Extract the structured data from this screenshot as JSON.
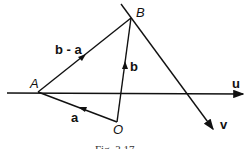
{
  "figure": {
    "points": {
      "A": "A",
      "B": "B",
      "O": "O"
    },
    "vectors": {
      "a": "a",
      "b": "b",
      "b_minus_a": "b - a",
      "u": "u",
      "v": "v"
    },
    "caption": "Fig. 3.17"
  }
}
